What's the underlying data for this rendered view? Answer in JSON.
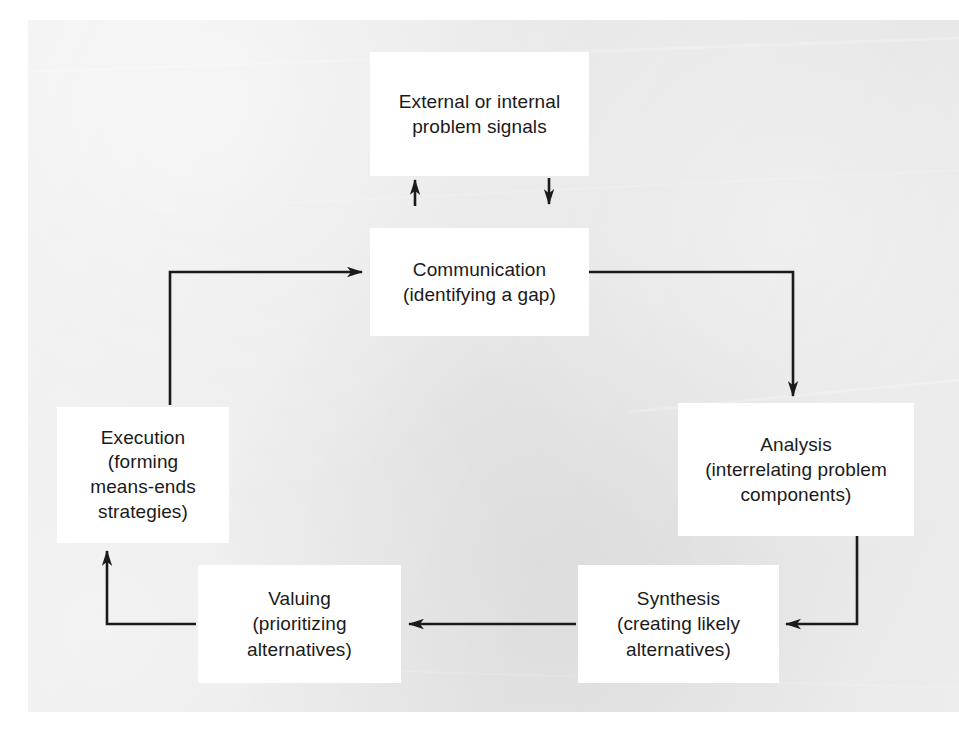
{
  "figure": {
    "panel_background_color": "#e9e9e9",
    "box_background_color": "#ffffff",
    "line_color": "#1a1a1a"
  },
  "nodes": [
    {
      "id": "problem-signals",
      "label": "External or internal\nproblem signals",
      "line1": "External or internal",
      "line2": "problem signals"
    },
    {
      "id": "communication",
      "label": "Communication\n(identifying a gap)",
      "line1": "Communication",
      "line2": "(identifying a gap)"
    },
    {
      "id": "analysis",
      "label": "Analysis\n(interrelating problem\ncomponents)",
      "line1": "Analysis",
      "line2": "(interrelating problem",
      "line3": "components)"
    },
    {
      "id": "synthesis",
      "label": "Synthesis\n(creating likely\nalternatives)",
      "line1": "Synthesis",
      "line2": "(creating likely",
      "line3": "alternatives)"
    },
    {
      "id": "valuing",
      "label": "Valuing\n(prioritizing\nalternatives)",
      "line1": "Valuing",
      "line2": "(prioritizing",
      "line3": "alternatives)"
    },
    {
      "id": "execution",
      "label": "Execution\n(forming\nmeans-ends\nstrategies)",
      "line1": "Execution",
      "line2": "(forming",
      "line3": "means-ends",
      "line4": "strategies)"
    }
  ],
  "connectors": [
    {
      "id": "signals-to-communication",
      "from": "problem-signals",
      "to": "communication",
      "direction": "down",
      "style": "straight"
    },
    {
      "id": "communication-to-signals",
      "from": "communication",
      "to": "problem-signals",
      "direction": "up",
      "style": "straight"
    },
    {
      "id": "communication-to-analysis",
      "from": "communication",
      "to": "analysis",
      "direction": "right-then-down",
      "style": "elbow"
    },
    {
      "id": "analysis-to-synthesis",
      "from": "analysis",
      "to": "synthesis",
      "direction": "down-then-left",
      "style": "elbow"
    },
    {
      "id": "synthesis-to-valuing",
      "from": "synthesis",
      "to": "valuing",
      "direction": "left",
      "style": "straight"
    },
    {
      "id": "valuing-to-execution",
      "from": "valuing",
      "to": "execution",
      "direction": "left-then-up",
      "style": "elbow"
    },
    {
      "id": "execution-to-communication",
      "from": "execution",
      "to": "communication",
      "direction": "up-then-right",
      "style": "elbow"
    }
  ]
}
